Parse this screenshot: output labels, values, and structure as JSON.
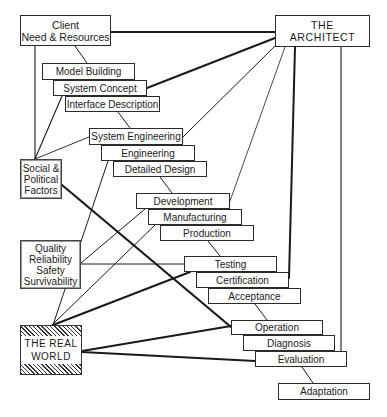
{
  "diagram": {
    "nodes": {
      "client": {
        "line1": "Client",
        "line2": "Need & Resources"
      },
      "architect": {
        "line1": "THE",
        "line2": "ARCHITECT"
      },
      "model_building": "Model Building",
      "system_concept": "System Concept",
      "interface_description": "Interface Description",
      "system_engineering": "System Engineering",
      "engineering": "Engineering",
      "detailed_design": "Detailed Design",
      "social": {
        "line1": "Social &",
        "line2": "Political",
        "line3": "Factors"
      },
      "development": "Development",
      "manufacturing": "Manufacturing",
      "production": "Production",
      "quality": {
        "line1": "Quality",
        "line2": "Reliability",
        "line3": "Safety",
        "line4": "Survivability"
      },
      "testing": "Testing",
      "certification": "Certification",
      "acceptance": "Acceptance",
      "real_world": {
        "line1": "THE REAL",
        "line2": "WORLD"
      },
      "operation": "Operation",
      "diagnosis": "Diagnosis",
      "evaluation": "Evaluation",
      "adaptation": "Adaptation"
    },
    "colors": {
      "line": "#1a1a1a",
      "box_border": "#2a2a2a",
      "background": "#ffffff"
    }
  }
}
